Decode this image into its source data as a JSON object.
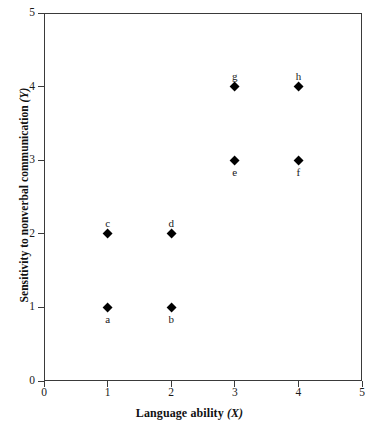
{
  "chart_data": {
    "type": "scatter",
    "title": "",
    "xlabel": "Language ability (X)",
    "ylabel": "Sensitivity to nonverbal communication (Y)",
    "xlabel_text": "Language ability",
    "xlabel_var": "(X)",
    "ylabel_text": "Sensitivity to nonverbal communication",
    "ylabel_var": "(Y)",
    "xlim": [
      0,
      5
    ],
    "ylim": [
      0,
      5
    ],
    "xticks": [
      0,
      1,
      2,
      3,
      4,
      5
    ],
    "yticks": [
      0,
      1,
      2,
      3,
      4,
      5
    ],
    "xtick_labels": [
      "0",
      "1",
      "2",
      "3",
      "4",
      "5"
    ],
    "ytick_labels": [
      "0",
      "1",
      "2",
      "3",
      "4",
      "5"
    ],
    "grid": false,
    "legend": null,
    "marker": "filled-diamond",
    "marker_color": "#000000",
    "frame_color": "#3a3a3a",
    "background": "#ffffff",
    "points": [
      {
        "label": "a",
        "x": 1,
        "y": 1,
        "label_pos": "below"
      },
      {
        "label": "b",
        "x": 2,
        "y": 1,
        "label_pos": "below"
      },
      {
        "label": "c",
        "x": 1,
        "y": 2,
        "label_pos": "above"
      },
      {
        "label": "d",
        "x": 2,
        "y": 2,
        "label_pos": "above"
      },
      {
        "label": "e",
        "x": 3,
        "y": 3,
        "label_pos": "below"
      },
      {
        "label": "f",
        "x": 4,
        "y": 3,
        "label_pos": "below"
      },
      {
        "label": "g",
        "x": 3,
        "y": 4,
        "label_pos": "above"
      },
      {
        "label": "h",
        "x": 4,
        "y": 4,
        "label_pos": "above"
      }
    ]
  }
}
